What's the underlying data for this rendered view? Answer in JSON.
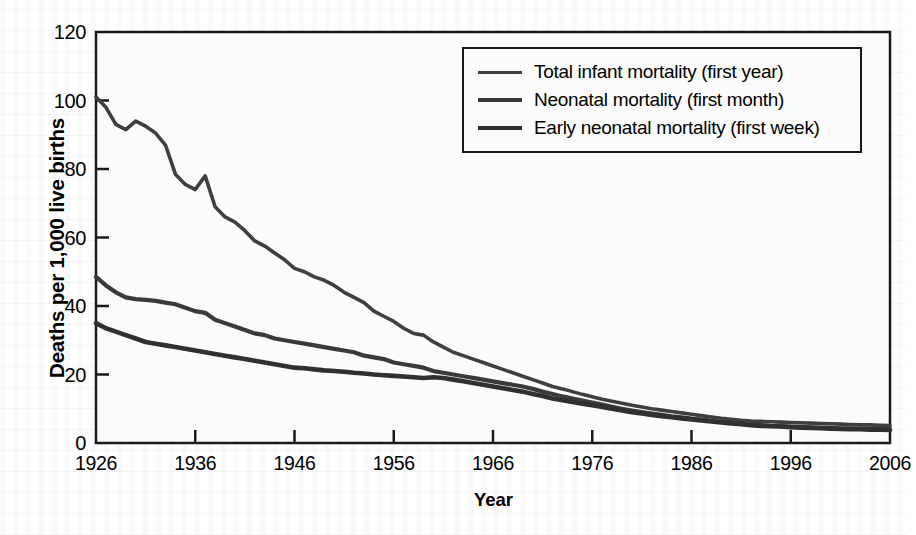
{
  "figure": {
    "plot_bg": "#fbfbfb",
    "axis_color": "#1a1a1a",
    "line_color": "#3a3a3a"
  },
  "axes": {
    "y_title": "Deaths per 1,000 live births",
    "x_title": "Year",
    "y_ticks": [
      0,
      20,
      40,
      60,
      80,
      100,
      120
    ],
    "x_ticks": [
      1926,
      1936,
      1946,
      1956,
      1966,
      1976,
      1986,
      1996,
      2006
    ]
  },
  "legend": {
    "items": [
      {
        "label": "Total infant mortality (first year)",
        "color": "#3f3f3f",
        "width": 3.6
      },
      {
        "label": "Neonatal mortality (first month)",
        "color": "#3a3a3a",
        "width": 4.2
      },
      {
        "label": "Early neonatal mortality (first week)",
        "color": "#303030",
        "width": 4.6
      }
    ]
  },
  "chart_data": {
    "type": "line",
    "title": "",
    "xlabel": "Year",
    "ylabel": "Deaths per 1,000 live births",
    "xlim": [
      1926,
      2006
    ],
    "ylim": [
      0,
      120
    ],
    "grid": false,
    "legend_position": "top-right",
    "x": [
      1926,
      1927,
      1928,
      1929,
      1930,
      1931,
      1932,
      1933,
      1934,
      1935,
      1936,
      1937,
      1938,
      1939,
      1940,
      1941,
      1942,
      1943,
      1944,
      1945,
      1946,
      1947,
      1948,
      1949,
      1950,
      1951,
      1952,
      1953,
      1954,
      1955,
      1956,
      1957,
      1958,
      1959,
      1960,
      1961,
      1962,
      1963,
      1964,
      1965,
      1966,
      1967,
      1968,
      1969,
      1970,
      1971,
      1972,
      1973,
      1974,
      1975,
      1976,
      1977,
      1978,
      1979,
      1980,
      1981,
      1982,
      1983,
      1984,
      1985,
      1986,
      1987,
      1988,
      1989,
      1990,
      1991,
      1992,
      1993,
      1994,
      1995,
      1996,
      1997,
      1998,
      1999,
      2000,
      2001,
      2002,
      2003,
      2004,
      2005,
      2006
    ],
    "series": [
      {
        "name": "Total infant mortality (first year)",
        "values": [
          101,
          98,
          93,
          91.5,
          94,
          92.5,
          90.5,
          87,
          78.5,
          75.5,
          74,
          78,
          69,
          66,
          64.5,
          62,
          59,
          57.5,
          55.5,
          53.5,
          51,
          50,
          48.5,
          47.5,
          46,
          44,
          42.5,
          41,
          38.5,
          37,
          35.5,
          33.5,
          32,
          31.5,
          29.5,
          28,
          26.5,
          25.5,
          24.5,
          23.5,
          22.5,
          21.5,
          20.5,
          19.5,
          18.5,
          17.5,
          16.5,
          15.8,
          15,
          14.2,
          13.5,
          12.8,
          12.2,
          11.6,
          11,
          10.5,
          10,
          9.6,
          9.2,
          8.8,
          8.4,
          8,
          7.6,
          7.2,
          6.9,
          6.6,
          6.4,
          6.3,
          6.2,
          6.1,
          6.0,
          5.9,
          5.8,
          5.7,
          5.6,
          5.5,
          5.4,
          5.3,
          5.3,
          5.2,
          5.1
        ]
      },
      {
        "name": "Neonatal mortality (first month)",
        "values": [
          48.5,
          46,
          44,
          42.5,
          42,
          41.8,
          41.5,
          41,
          40.5,
          39.5,
          38.5,
          38,
          36,
          35,
          34,
          33,
          32,
          31.5,
          30.5,
          30,
          29.5,
          29,
          28.5,
          28,
          27.5,
          27,
          26.5,
          25.5,
          25,
          24.5,
          23.5,
          23,
          22.5,
          22,
          21,
          20.5,
          20,
          19.5,
          19,
          18.5,
          18,
          17.5,
          17,
          16.5,
          15.8,
          15,
          14.3,
          13.6,
          13,
          12.4,
          11.8,
          11.2,
          10.6,
          10,
          9.5,
          9,
          8.6,
          8.2,
          7.8,
          7.5,
          7.1,
          6.8,
          6.5,
          6.2,
          5.9,
          5.6,
          5.4,
          5.2,
          5.0,
          4.9,
          4.8,
          4.7,
          4.6,
          4.5,
          4.4,
          4.3,
          4.3,
          4.2,
          4.2,
          4.1,
          4.0
        ]
      },
      {
        "name": "Early neonatal mortality (first week)",
        "values": [
          35,
          33.5,
          32.5,
          31.5,
          30.5,
          29.5,
          29,
          28.5,
          28,
          27.5,
          27,
          26.5,
          26,
          25.5,
          25,
          24.5,
          24,
          23.5,
          23,
          22.5,
          22,
          21.8,
          21.5,
          21.2,
          21,
          20.8,
          20.5,
          20.3,
          20,
          19.8,
          19.6,
          19.4,
          19.2,
          19,
          19.2,
          19,
          18.5,
          18,
          17.5,
          17,
          16.5,
          16,
          15.5,
          15,
          14.3,
          13.7,
          13,
          12.5,
          12,
          11.5,
          11,
          10.5,
          10,
          9.5,
          9,
          8.6,
          8.2,
          7.8,
          7.5,
          7.2,
          6.9,
          6.6,
          6.3,
          6,
          5.7,
          5.5,
          5.2,
          5.0,
          4.9,
          4.8,
          4.6,
          4.5,
          4.4,
          4.3,
          4.2,
          4.1,
          4.0,
          4.0,
          3.9,
          3.9,
          3.8
        ]
      }
    ]
  }
}
